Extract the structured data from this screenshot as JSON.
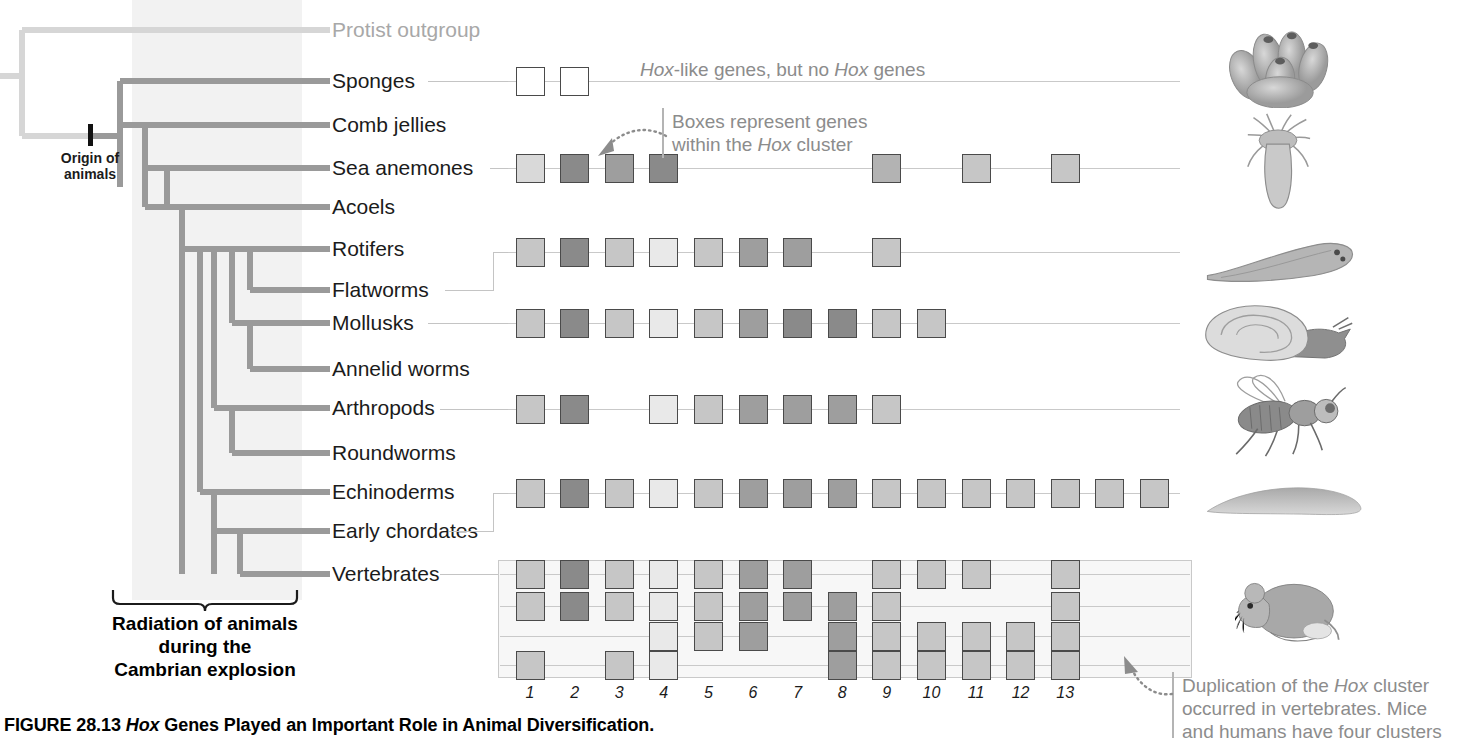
{
  "figure": {
    "caption_prefix": "FIGURE 28.13 ",
    "caption_italic": "Hox",
    "caption_rest": " Genes Played an Important Role in Animal Diversification."
  },
  "tree": {
    "origin_label_line1": "Origin of",
    "origin_label_line2": "animals",
    "cambrian_line1": "Radiation of animals",
    "cambrian_line2": "during the",
    "cambrian_line3": "Cambrian explosion",
    "taxa": [
      {
        "label": "Protist outgroup",
        "y": 30,
        "grey": true
      },
      {
        "label": "Sponges",
        "y": 81,
        "grey": false
      },
      {
        "label": "Comb jellies",
        "y": 125,
        "grey": false
      },
      {
        "label": "Sea anemones",
        "y": 168,
        "grey": false
      },
      {
        "label": "Acoels",
        "y": 207,
        "grey": false
      },
      {
        "label": "Rotifers",
        "y": 249,
        "grey": false
      },
      {
        "label": "Flatworms",
        "y": 290,
        "grey": false
      },
      {
        "label": "Mollusks",
        "y": 323,
        "grey": false
      },
      {
        "label": "Annelid worms",
        "y": 369,
        "grey": false
      },
      {
        "label": "Arthropods",
        "y": 408,
        "grey": false
      },
      {
        "label": "Roundworms",
        "y": 453,
        "grey": false
      },
      {
        "label": "Echinoderms",
        "y": 492,
        "grey": false
      },
      {
        "label": "Early chordates",
        "y": 531,
        "grey": false
      },
      {
        "label": "Vertebrates",
        "y": 574,
        "grey": false
      }
    ]
  },
  "annotations": {
    "hox_like_pre": "",
    "hox_like_text_a": "Hox",
    "hox_like_text_b": "-like genes, but no ",
    "hox_like_text_c": "Hox",
    "hox_like_text_d": " genes",
    "boxes_line1": "Boxes represent genes",
    "boxes_line2a": "within the ",
    "boxes_line2b": "Hox",
    "boxes_line2c": " cluster",
    "dup_line1a": "Duplication of the ",
    "dup_line1b": "Hox",
    "dup_line1c": " cluster",
    "dup_line2": "occurred in vertebrates. Mice",
    "dup_line3": "and humans have four clusters"
  },
  "chart_data": {
    "type": "heatmap",
    "columns": [
      "1",
      "2",
      "3",
      "4",
      "5",
      "6",
      "7",
      "8",
      "9",
      "10",
      "11",
      "12",
      "13"
    ],
    "column_label_note": "Hox cluster paralog group numbers",
    "xlabel": "Hox cluster position",
    "ylabel": "Lineage",
    "legend": "Box shading = distinct Hox gene; white box = Hox-like gene (not true Hox)",
    "shades": {
      "white": "#ffffff",
      "light1": "#e9e9e9",
      "light2": "#d9d9d9",
      "mid1": "#c6c6c6",
      "mid2": "#b3b3b3",
      "dark1": "#9e9e9e",
      "dark2": "#8a8a8a"
    },
    "rows": [
      {
        "taxon": "Sponges",
        "y": 81,
        "line_start": 508,
        "line_end": 1180,
        "cells": [
          {
            "col": 1,
            "shade": "white"
          },
          {
            "col": 2,
            "shade": "white"
          }
        ]
      },
      {
        "taxon": "Sea anemones",
        "y": 168,
        "line_start": 508,
        "line_end": 1180,
        "cells": [
          {
            "col": 1,
            "shade": "light2"
          },
          {
            "col": 2,
            "shade": "dark2"
          },
          {
            "col": 3,
            "shade": "dark1"
          },
          {
            "col": 4,
            "shade": "dark2"
          },
          {
            "col": 9,
            "shade": "mid2"
          },
          {
            "col": 11,
            "shade": "mid1"
          },
          {
            "col": 13,
            "shade": "mid1"
          }
        ]
      },
      {
        "taxon": "Rotifers/Flatworms",
        "y": 252,
        "line_start": 508,
        "line_end": 1180,
        "cells": [
          {
            "col": 1,
            "shade": "mid1"
          },
          {
            "col": 2,
            "shade": "dark2"
          },
          {
            "col": 3,
            "shade": "mid1"
          },
          {
            "col": 4,
            "shade": "light1"
          },
          {
            "col": 5,
            "shade": "mid1"
          },
          {
            "col": 6,
            "shade": "dark1"
          },
          {
            "col": 7,
            "shade": "dark1"
          },
          {
            "col": 9,
            "shade": "mid1"
          }
        ]
      },
      {
        "taxon": "Mollusks/Annelid worms",
        "y": 323,
        "line_start": 508,
        "line_end": 1180,
        "cells": [
          {
            "col": 1,
            "shade": "mid1"
          },
          {
            "col": 2,
            "shade": "dark2"
          },
          {
            "col": 3,
            "shade": "mid1"
          },
          {
            "col": 4,
            "shade": "light1"
          },
          {
            "col": 5,
            "shade": "mid1"
          },
          {
            "col": 6,
            "shade": "dark1"
          },
          {
            "col": 7,
            "shade": "dark2"
          },
          {
            "col": 8,
            "shade": "dark2"
          },
          {
            "col": 9,
            "shade": "mid1"
          },
          {
            "col": 10,
            "shade": "mid1"
          }
        ]
      },
      {
        "taxon": "Arthropods/Roundworms",
        "y": 409,
        "line_start": 508,
        "line_end": 1180,
        "cells": [
          {
            "col": 1,
            "shade": "mid1"
          },
          {
            "col": 2,
            "shade": "dark2"
          },
          {
            "col": 4,
            "shade": "light1"
          },
          {
            "col": 5,
            "shade": "mid1"
          },
          {
            "col": 6,
            "shade": "dark1"
          },
          {
            "col": 7,
            "shade": "dark1"
          },
          {
            "col": 8,
            "shade": "dark1"
          },
          {
            "col": 9,
            "shade": "mid1"
          }
        ]
      },
      {
        "taxon": "Echinoderms/Early chordates",
        "y": 493,
        "line_start": 508,
        "line_end": 1180,
        "cells": [
          {
            "col": 1,
            "shade": "mid1"
          },
          {
            "col": 2,
            "shade": "dark2"
          },
          {
            "col": 3,
            "shade": "mid1"
          },
          {
            "col": 4,
            "shade": "light1"
          },
          {
            "col": 5,
            "shade": "mid1"
          },
          {
            "col": 6,
            "shade": "dark1"
          },
          {
            "col": 7,
            "shade": "dark1"
          },
          {
            "col": 8,
            "shade": "dark1"
          },
          {
            "col": 9,
            "shade": "mid1"
          },
          {
            "col": 10,
            "shade": "mid1"
          },
          {
            "col": 11,
            "shade": "mid1"
          },
          {
            "col": 12,
            "shade": "mid1"
          },
          {
            "col": 13,
            "shade": "mid1"
          },
          {
            "col": 14,
            "shade": "mid1"
          },
          {
            "col": 15,
            "shade": "mid1"
          }
        ]
      }
    ],
    "vertebrate_clusters": [
      {
        "name": "cluster-a",
        "y": 574,
        "cells": [
          {
            "col": 1,
            "shade": "mid1"
          },
          {
            "col": 2,
            "shade": "dark2"
          },
          {
            "col": 3,
            "shade": "mid1"
          },
          {
            "col": 4,
            "shade": "light1"
          },
          {
            "col": 5,
            "shade": "mid1"
          },
          {
            "col": 6,
            "shade": "dark1"
          },
          {
            "col": 7,
            "shade": "dark1"
          },
          {
            "col": 9,
            "shade": "mid1"
          },
          {
            "col": 10,
            "shade": "mid1"
          },
          {
            "col": 11,
            "shade": "mid1"
          },
          {
            "col": 13,
            "shade": "mid1"
          }
        ]
      },
      {
        "name": "cluster-b",
        "y": 606,
        "cells": [
          {
            "col": 1,
            "shade": "mid1"
          },
          {
            "col": 2,
            "shade": "dark2"
          },
          {
            "col": 3,
            "shade": "mid1"
          },
          {
            "col": 4,
            "shade": "light1"
          },
          {
            "col": 5,
            "shade": "mid1"
          },
          {
            "col": 6,
            "shade": "dark1"
          },
          {
            "col": 7,
            "shade": "dark1"
          },
          {
            "col": 8,
            "shade": "dark1"
          },
          {
            "col": 9,
            "shade": "mid1"
          },
          {
            "col": 13,
            "shade": "mid1"
          }
        ]
      },
      {
        "name": "cluster-c",
        "y": 636,
        "cells": [
          {
            "col": 4,
            "shade": "light1"
          },
          {
            "col": 5,
            "shade": "mid1"
          },
          {
            "col": 6,
            "shade": "dark1"
          },
          {
            "col": 8,
            "shade": "dark1"
          },
          {
            "col": 9,
            "shade": "mid1"
          },
          {
            "col": 10,
            "shade": "mid1"
          },
          {
            "col": 11,
            "shade": "mid1"
          },
          {
            "col": 12,
            "shade": "mid1"
          },
          {
            "col": 13,
            "shade": "mid1"
          }
        ]
      },
      {
        "name": "cluster-d",
        "y": 665,
        "cells": [
          {
            "col": 1,
            "shade": "mid1"
          },
          {
            "col": 3,
            "shade": "mid1"
          },
          {
            "col": 4,
            "shade": "light1"
          },
          {
            "col": 8,
            "shade": "dark1"
          },
          {
            "col": 9,
            "shade": "mid1"
          },
          {
            "col": 10,
            "shade": "mid1"
          },
          {
            "col": 11,
            "shade": "mid1"
          },
          {
            "col": 12,
            "shade": "mid1"
          },
          {
            "col": 13,
            "shade": "mid1"
          }
        ]
      }
    ],
    "geometry": {
      "col1_center": 530,
      "col_step": 44.6,
      "box_size": 29
    }
  },
  "artwork": [
    {
      "name": "sponge-illustration",
      "taxon": "Sponges",
      "x": 1222,
      "y": 28,
      "w": 120,
      "h": 80
    },
    {
      "name": "sea-anemone-illustration",
      "taxon": "Sea anemones",
      "x": 1232,
      "y": 112,
      "w": 92,
      "h": 100
    },
    {
      "name": "flatworm-illustration",
      "taxon": "Flatworms",
      "x": 1200,
      "y": 233,
      "w": 160,
      "h": 58
    },
    {
      "name": "snail-illustration",
      "taxon": "Mollusks",
      "x": 1198,
      "y": 300,
      "w": 160,
      "h": 64
    },
    {
      "name": "fly-illustration",
      "taxon": "Arthropods",
      "x": 1218,
      "y": 372,
      "w": 140,
      "h": 88
    },
    {
      "name": "sea-cucumber-illustration",
      "taxon": "Echinoderms",
      "x": 1200,
      "y": 483,
      "w": 168,
      "h": 36
    },
    {
      "name": "mouse-illustration",
      "taxon": "Vertebrates",
      "x": 1235,
      "y": 560,
      "w": 118,
      "h": 88
    }
  ]
}
